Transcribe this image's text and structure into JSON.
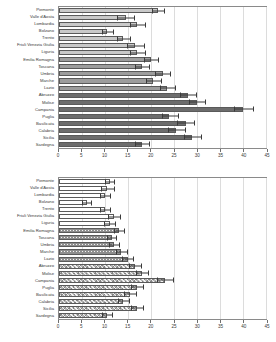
{
  "figure": {
    "title": "",
    "regions": [
      "Piemonte",
      "Valle d'Aosta",
      "Lombardia",
      "Bolzano",
      "Trento",
      "Friuli Venezia Giulia",
      "Liguria",
      "Emilia Romagna",
      "Toscana",
      "Umbria",
      "Marche",
      "Lazio",
      "Abruzzo",
      "Molise",
      "Campania",
      "Puglia",
      "Basilicata",
      "Calabria",
      "Sicilia",
      "Sardegna"
    ]
  },
  "chart_data": [
    {
      "type": "bar",
      "orientation": "horizontal",
      "panel": "top",
      "title": "",
      "xlabel": "",
      "ylabel": "",
      "xlim": [
        0,
        45
      ],
      "xticks": [
        0,
        5,
        10,
        15,
        20,
        25,
        30,
        35,
        40,
        45
      ],
      "xticklabels": [
        "0",
        "5",
        "10",
        "15",
        "20",
        "25",
        "30",
        "35",
        "40",
        "45"
      ],
      "grid": true,
      "legend": "none",
      "categories": [
        "Piemonte",
        "Valle d'Aosta",
        "Lombardia",
        "Bolzano",
        "Trento",
        "Friuli Venezia Giulia",
        "Liguria",
        "Emilia Romagna",
        "Toscana",
        "Umbria",
        "Marche",
        "Lazio",
        "Abruzzo",
        "Molise",
        "Campania",
        "Puglia",
        "Basilicata",
        "Calabria",
        "Sicilia",
        "Sardegna"
      ],
      "values": [
        21.5,
        14.5,
        17.0,
        10.5,
        14.0,
        16.5,
        17.0,
        20.0,
        18.0,
        22.5,
        20.5,
        23.5,
        28.0,
        30.0,
        40.0,
        24.0,
        27.5,
        25.5,
        29.0,
        18.0
      ],
      "err_low": [
        1.2,
        1.8,
        1.4,
        1.1,
        1.3,
        1.6,
        1.5,
        1.4,
        1.3,
        1.5,
        1.4,
        1.5,
        1.6,
        1.6,
        1.9,
        1.6,
        1.7,
        1.6,
        1.7,
        1.4
      ],
      "err_high": [
        1.5,
        2.0,
        1.8,
        1.3,
        1.5,
        2.0,
        1.8,
        1.6,
        1.6,
        1.8,
        1.7,
        1.8,
        1.9,
        1.8,
        2.2,
        1.9,
        2.0,
        1.9,
        2.0,
        1.6
      ],
      "fills": [
        "f-light",
        "f-light",
        "f-light",
        "f-light",
        "f-light",
        "f-light",
        "f-light",
        "f-mid",
        "f-mid",
        "f-mid",
        "f-mid",
        "f-mid",
        "f-dark",
        "f-dark",
        "f-dark",
        "f-dark",
        "f-dark",
        "f-dark",
        "f-dark",
        "f-dark"
      ]
    },
    {
      "type": "bar",
      "orientation": "horizontal",
      "panel": "bottom",
      "title": "",
      "xlabel": "",
      "ylabel": "",
      "xlim": [
        0,
        45
      ],
      "xticks": [
        0,
        5,
        10,
        15,
        20,
        25,
        30,
        35,
        40,
        45
      ],
      "xticklabels": [
        "0",
        "5",
        "10",
        "15",
        "20",
        "25",
        "30",
        "35",
        "40",
        "45"
      ],
      "grid": true,
      "legend": "none",
      "categories": [
        "Piemonte",
        "Valle d'Aosta",
        "Lombardia",
        "Bolzano",
        "Trento",
        "Friuli Venezia Giulia",
        "Liguria",
        "Emilia Romagna",
        "Toscana",
        "Umbria",
        "Marche",
        "Lazio",
        "Abruzzo",
        "Molise",
        "Campania",
        "Puglia",
        "Basilicata",
        "Calabria",
        "Sicilia",
        "Sardegna"
      ],
      "values": [
        11.0,
        10.5,
        10.0,
        6.0,
        10.0,
        12.0,
        11.0,
        13.0,
        11.5,
        12.0,
        13.5,
        15.0,
        16.5,
        18.0,
        23.0,
        17.0,
        15.5,
        14.0,
        17.0,
        10.5
      ],
      "err_low": [
        0.9,
        1.3,
        0.9,
        0.8,
        1.0,
        1.2,
        1.0,
        1.0,
        0.9,
        1.0,
        1.1,
        1.1,
        1.2,
        1.2,
        1.5,
        1.2,
        1.2,
        1.1,
        1.2,
        1.0
      ],
      "err_high": [
        1.1,
        1.5,
        1.1,
        1.0,
        1.2,
        1.4,
        1.2,
        1.2,
        1.1,
        1.2,
        1.3,
        1.3,
        1.4,
        1.4,
        1.8,
        1.4,
        1.4,
        1.3,
        1.4,
        1.2
      ],
      "fills": [
        "f-white",
        "f-white",
        "f-white",
        "f-white",
        "f-white",
        "f-white",
        "f-white",
        "f-dot",
        "f-dot",
        "f-dot",
        "f-dot",
        "f-dot",
        "f-hatch",
        "f-hatch",
        "f-hatch",
        "f-hatch",
        "f-hatch",
        "f-hatch",
        "f-hatch",
        "f-hatch"
      ]
    }
  ],
  "colors": {
    "axis": "#8a8a8a",
    "grid": "#dcdcdc",
    "error": "#3a3a3a",
    "text": "#3a3a3a"
  }
}
